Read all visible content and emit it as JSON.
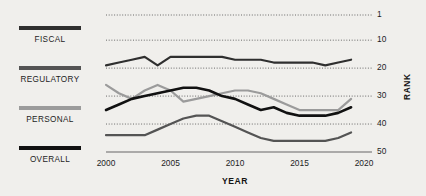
{
  "chart_data": {
    "type": "line",
    "title": "",
    "xlabel": "YEAR",
    "ylabel": "RANK",
    "xlim": [
      2000,
      2020
    ],
    "ylim": [
      1,
      50
    ],
    "y_inverted": true,
    "grid": "horizontal-dotted",
    "legend_position": "left",
    "x_ticks": [
      "2000",
      "2005",
      "2010",
      "2015",
      "2020"
    ],
    "y_ticks": [
      "1",
      "10",
      "20",
      "30",
      "40",
      "50"
    ],
    "x": [
      2000,
      2001,
      2002,
      2003,
      2004,
      2005,
      2006,
      2007,
      2008,
      2009,
      2010,
      2011,
      2012,
      2013,
      2014,
      2015,
      2016,
      2017,
      2018,
      2019
    ],
    "series": [
      {
        "name": "FISCAL",
        "color": "#2f2f2f",
        "values": [
          19,
          18,
          17,
          16,
          19,
          16,
          16,
          16,
          16,
          16,
          17,
          17,
          17,
          18,
          18,
          18,
          18,
          19,
          18,
          17
        ]
      },
      {
        "name": "REGULATORY",
        "color": "#545454",
        "values": [
          44,
          44,
          44,
          44,
          42,
          40,
          38,
          37,
          37,
          39,
          41,
          43,
          45,
          46,
          46,
          46,
          46,
          46,
          45,
          43
        ]
      },
      {
        "name": "PERSONAL",
        "color": "#9b9b9b",
        "values": [
          26,
          29,
          31,
          28,
          26,
          28,
          32,
          31,
          30,
          29,
          28,
          28,
          29,
          31,
          33,
          35,
          35,
          35,
          35,
          31
        ]
      },
      {
        "name": "OVERALL",
        "color": "#111111",
        "values": [
          35,
          33,
          31,
          30,
          29,
          28,
          27,
          27,
          28,
          30,
          31,
          33,
          35,
          34,
          36,
          37,
          37,
          37,
          36,
          34
        ]
      }
    ]
  },
  "legend": {
    "items": [
      {
        "label": "FISCAL",
        "color": "#2f2f2f"
      },
      {
        "label": "REGULATORY",
        "color": "#545454"
      },
      {
        "label": "PERSONAL",
        "color": "#9b9b9b"
      },
      {
        "label": "OVERALL",
        "color": "#111111"
      }
    ]
  },
  "axes": {
    "y_title": "RANK",
    "x_title": "YEAR"
  }
}
